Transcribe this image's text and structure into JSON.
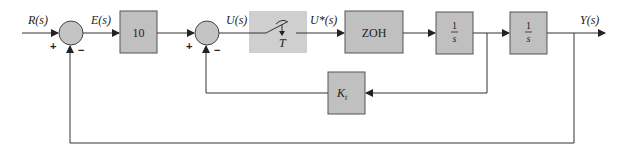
{
  "diagram": {
    "type": "block-diagram",
    "signals": {
      "input": "R(s)",
      "error": "E(s)",
      "control": "U(s)",
      "sampled": "U*(s)",
      "output": "Y(s)"
    },
    "blocks": {
      "gain": "10",
      "sampler_period": "T",
      "zoh": "ZOH",
      "integrator1_num": "1",
      "integrator1_den": "s",
      "integrator2_num": "1",
      "integrator2_den": "s",
      "feedback_gain_main": "K",
      "feedback_gain_sub": "t"
    },
    "summing_junctions": [
      {
        "id": "sum1",
        "plus": "+",
        "minus": "−"
      },
      {
        "id": "sum2",
        "plus": "+",
        "minus": "−"
      }
    ],
    "colors": {
      "block_fill": "#c0c0c0",
      "sampler_fill": "#cfcfcf",
      "line": "#333333"
    }
  }
}
